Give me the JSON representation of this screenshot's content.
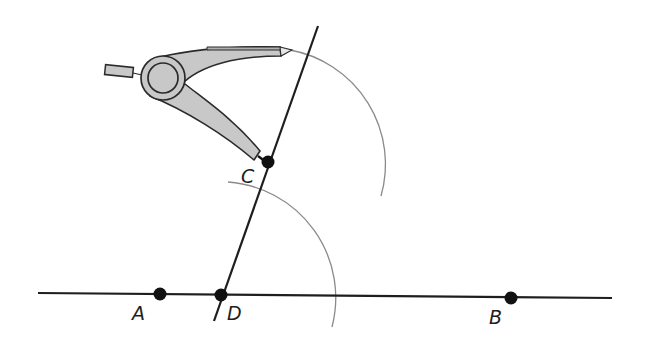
{
  "diagram": {
    "type": "geometric-construction",
    "colors": {
      "line": "#1e1e1e",
      "arc": "#8a8a8a",
      "point": "#111111",
      "compass_fill": "#c8c8c8",
      "compass_stroke": "#2a2a2a"
    },
    "points": [
      {
        "id": "A",
        "label": "A",
        "x": 160,
        "y": 294,
        "label_x": 132,
        "label_y": 320
      },
      {
        "id": "D",
        "label": "D",
        "x": 221,
        "y": 295,
        "label_x": 227,
        "label_y": 320
      },
      {
        "id": "B",
        "label": "B",
        "x": 511,
        "y": 298,
        "label_x": 489,
        "label_y": 324
      },
      {
        "id": "C",
        "label": "C",
        "x": 268,
        "y": 162,
        "label_x": 241,
        "label_y": 183
      }
    ],
    "lines": [
      {
        "id": "line-AB",
        "x1": 38,
        "y1": 293,
        "x2": 612,
        "y2": 298
      },
      {
        "id": "line-DC",
        "x1": 214,
        "y1": 321,
        "x2": 318,
        "y2": 26
      }
    ],
    "arcs": [
      {
        "id": "arc-from-C",
        "center": "C",
        "start_x": 290,
        "start_y": 50,
        "end_x": 381,
        "end_y": 196,
        "radius": 116
      },
      {
        "id": "arc-from-D",
        "center": "D",
        "start_x": 228,
        "start_y": 182,
        "end_x": 332,
        "end_y": 327,
        "radius": 116
      }
    ],
    "compass": {
      "hinge_x": 163,
      "hinge_y": 78,
      "hinge_outer_r": 22,
      "hinge_inner_r": 15,
      "pencil_tip_x": 292,
      "pencil_tip_y": 50,
      "needle_tip_x": 266,
      "needle_tip_y": 162
    }
  }
}
